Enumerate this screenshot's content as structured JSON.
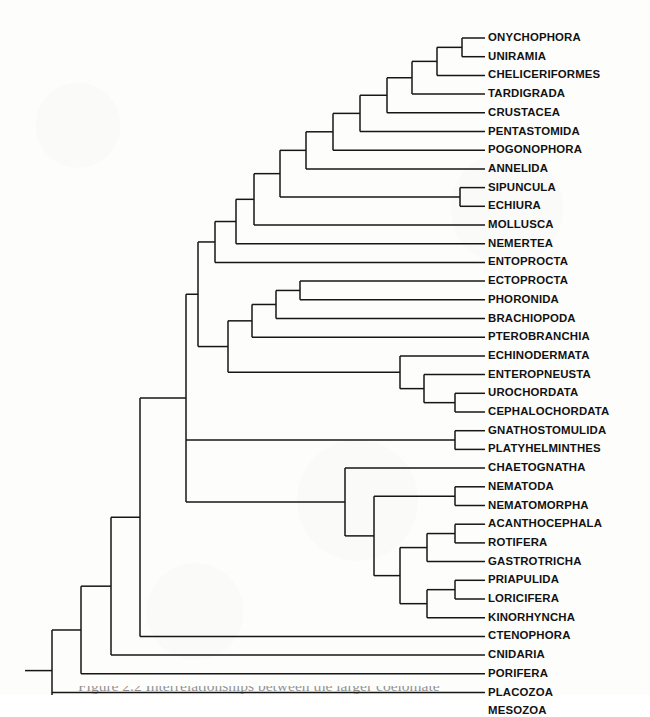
{
  "figure": {
    "caption_partial": "Figure 2.2  Interrelationships between the larger coelomate",
    "tip_count": 35,
    "line_color": "#161616",
    "background_color": "#fdfdfc",
    "text_color": "#121212"
  },
  "layout": {
    "tip_x": 485,
    "label_x": 488,
    "first_row_y": 38,
    "row_step": 18.7,
    "root_stem_x": 25,
    "line_width": 1.5
  },
  "taxa": [
    {
      "index": 0,
      "name": "ONYCHOPHORA"
    },
    {
      "index": 1,
      "name": "UNIRAMIA"
    },
    {
      "index": 2,
      "name": "CHELICERIFORMES"
    },
    {
      "index": 3,
      "name": "TARDIGRADA"
    },
    {
      "index": 4,
      "name": "CRUSTACEA"
    },
    {
      "index": 5,
      "name": "PENTASTOMIDA"
    },
    {
      "index": 6,
      "name": "POGONOPHORA"
    },
    {
      "index": 7,
      "name": "ANNELIDA"
    },
    {
      "index": 8,
      "name": "SIPUNCULA"
    },
    {
      "index": 9,
      "name": "ECHIURA"
    },
    {
      "index": 10,
      "name": "MOLLUSCA"
    },
    {
      "index": 11,
      "name": "NEMERTEA"
    },
    {
      "index": 12,
      "name": "ENTOPROCTA"
    },
    {
      "index": 13,
      "name": "ECTOPROCTA"
    },
    {
      "index": 14,
      "name": "PHORONIDA"
    },
    {
      "index": 15,
      "name": "BRACHIOPODA"
    },
    {
      "index": 16,
      "name": "PTEROBRANCHIA"
    },
    {
      "index": 17,
      "name": "ECHINODERMATA"
    },
    {
      "index": 18,
      "name": "ENTEROPNEUSTA"
    },
    {
      "index": 19,
      "name": "UROCHORDATA"
    },
    {
      "index": 20,
      "name": "CEPHALOCHORDATA"
    },
    {
      "index": 21,
      "name": "GNATHOSTOMULIDA"
    },
    {
      "index": 22,
      "name": "PLATYHELMINTHES"
    },
    {
      "index": 23,
      "name": "CHAETOGNATHA"
    },
    {
      "index": 24,
      "name": "NEMATODA"
    },
    {
      "index": 25,
      "name": "NEMATOMORPHA"
    },
    {
      "index": 26,
      "name": "ACANTHOCEPHALA"
    },
    {
      "index": 27,
      "name": "ROTIFERA"
    },
    {
      "index": 28,
      "name": "GASTROTRICHA"
    },
    {
      "index": 29,
      "name": "PRIAPULIDA"
    },
    {
      "index": 30,
      "name": "LORICIFERA"
    },
    {
      "index": 31,
      "name": "KINORHYNCHA"
    },
    {
      "index": 32,
      "name": "CTENOPHORA"
    },
    {
      "index": 33,
      "name": "CNIDARIA"
    },
    {
      "index": 34,
      "name": "PORIFERA"
    },
    {
      "index": 35,
      "name": "PLACOZOA"
    },
    {
      "index": 36,
      "name": "MESOZOA"
    }
  ],
  "nodes": [
    {
      "id": "n_onych_unir",
      "x": 462,
      "children_rows": [
        0,
        1
      ],
      "label": "Onychophora + Uniramia"
    },
    {
      "id": "n_arthropod_top",
      "x": 437,
      "children_rows": [
        0.5,
        2
      ],
      "label": "with Cheliceriformes"
    },
    {
      "id": "n_sipun_echiura",
      "x": 460,
      "children_rows": [
        8,
        9
      ],
      "label": "Sipuncula + Echiura"
    },
    {
      "id": "n_uro_cephalo",
      "x": 455,
      "children_rows": [
        19,
        20
      ],
      "label": "Urochordata + Cephalochordata"
    },
    {
      "id": "n_chordata",
      "x": 424,
      "children_rows": [
        18,
        19.5
      ],
      "label": "Enteropneusta + chordates"
    },
    {
      "id": "n_deutero",
      "x": 400,
      "children_rows": [
        17,
        18.75
      ],
      "label": "Echinodermata + others"
    },
    {
      "id": "n_gnath_platy",
      "x": 455,
      "children_rows": [
        21,
        22
      ],
      "label": "Gnathostomulida + Platyhelminthes"
    },
    {
      "id": "n_nema_pair",
      "x": 455,
      "children_rows": [
        24,
        25
      ],
      "label": "Nematoda + Nematomorpha"
    },
    {
      "id": "n_acanth_rot",
      "x": 455,
      "children_rows": [
        26,
        27
      ],
      "label": "Acanthocephala + Rotifera"
    },
    {
      "id": "n_rotifera_grp",
      "x": 427,
      "children_rows": [
        26.5,
        28
      ],
      "label": "with Gastrotricha"
    },
    {
      "id": "n_pria_lori",
      "x": 455,
      "children_rows": [
        29,
        30
      ],
      "label": "Priapulida + Loricifera"
    },
    {
      "id": "n_scalid",
      "x": 427,
      "children_rows": [
        29.5,
        31
      ],
      "label": "with Kinorhyncha"
    },
    {
      "id": "n_aschel",
      "x": 400,
      "children_rows": [
        27.75,
        30.25
      ],
      "label": "Rotifera group + scalidophorans"
    },
    {
      "id": "n_pseudo",
      "x": 374,
      "children_rows": [
        24.5,
        29.0
      ],
      "label": "Nematoda group + aschelminths"
    },
    {
      "id": "n_lower_clade",
      "x": 345,
      "children_rows": [
        23,
        26.75
      ],
      "label": "Chaetognatha + pseudocoelomates"
    },
    {
      "id": "n_ladder_1",
      "x": 412,
      "children_rows": [
        1.25,
        3
      ],
      "label": "arthropod ladder: Tardigrada"
    },
    {
      "id": "n_ladder_2",
      "x": 387,
      "children_rows": [
        2.1,
        4
      ],
      "label": "arthropod ladder: Crustacea"
    },
    {
      "id": "n_ladder_3",
      "x": 360,
      "children_rows": [
        3.05,
        5
      ],
      "label": "arthropod ladder: Pentastomida"
    },
    {
      "id": "n_ladder_4",
      "x": 333,
      "children_rows": [
        4.0,
        6
      ],
      "label": "ladder: Pogonophora"
    },
    {
      "id": "n_ladder_5",
      "x": 306,
      "children_rows": [
        5.0,
        7
      ],
      "label": "ladder: Annelida"
    },
    {
      "id": "n_ladder_6",
      "x": 280,
      "children_rows": [
        6.0,
        8.5
      ],
      "label": "ladder: Sipuncula group"
    },
    {
      "id": "n_ladder_7",
      "x": 254,
      "children_rows": [
        7.25,
        10
      ],
      "label": "ladder: Mollusca"
    },
    {
      "id": "n_ladder_8",
      "x": 236,
      "children_rows": [
        8.6,
        11
      ],
      "label": "ladder: Nemertea"
    },
    {
      "id": "n_ladder_9",
      "x": 215,
      "children_rows": [
        9.8,
        12
      ],
      "label": "ladder: Entoprocta"
    },
    {
      "id": "n_lopho_1",
      "x": 300,
      "children_rows": [
        13,
        14
      ],
      "label": "Ectoprocta + Phoronida"
    },
    {
      "id": "n_lopho_2",
      "x": 276,
      "children_rows": [
        13.5,
        15
      ],
      "label": "with Brachiopoda"
    },
    {
      "id": "n_lopho_3",
      "x": 252,
      "children_rows": [
        14.25,
        16
      ],
      "label": "with Pterobranchia"
    },
    {
      "id": "n_lopho_deut",
      "x": 228,
      "children_rows": [
        15.1,
        17.9
      ],
      "label": "lophophorates + deuterostomes"
    },
    {
      "id": "n_upper_main",
      "x": 198,
      "children_rows": [
        10.9,
        16.5
      ],
      "label": "upper clade"
    },
    {
      "id": "n_acoelo",
      "x": 207,
      "children_rows": [
        21.5,
        21.5
      ],
      "label": "acoelomate branch"
    },
    {
      "id": "n_bilateria",
      "x": 186,
      "children_rows": [
        13.7,
        24.8
      ],
      "label": "Bilateria"
    },
    {
      "id": "n_cnid",
      "x": 140,
      "children_rows": [
        18.5,
        32
      ],
      "label": "with Ctenophora"
    },
    {
      "id": "n_eumet",
      "x": 111,
      "children_rows": [
        25.2,
        33
      ],
      "label": "with Cnidaria"
    },
    {
      "id": "n_porifera_node",
      "x": 81,
      "children_rows": [
        29.1,
        34
      ],
      "label": "with Porifera"
    },
    {
      "id": "n_placozoa_node",
      "x": 52,
      "children_rows": [
        31.5,
        35
      ],
      "label": "with Placozoa"
    },
    {
      "id": "n_root",
      "x": 52,
      "children_rows": [
        33.2,
        36
      ],
      "label": "root: with Mesozoa"
    }
  ]
}
